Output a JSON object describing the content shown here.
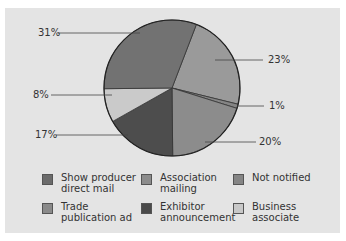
{
  "chart_data": {
    "type": "pie",
    "title": "",
    "categories": [
      "Show producer direct mail",
      "Trade publication ad",
      "Not notified",
      "Association mailing",
      "Exhibitor announcement",
      "Business associate"
    ],
    "values": [
      31,
      23,
      1,
      20,
      17,
      8
    ],
    "unit": "%",
    "colors": [
      "#727272",
      "#9a9a9a",
      "#858585",
      "#8c8c8c",
      "#4d4d4d",
      "#cacaca"
    ],
    "legend_position": "bottom",
    "slice_labels": [
      "31%",
      "23%",
      "1%",
      "20%",
      "17%",
      "8%"
    ]
  },
  "legend": [
    {
      "label": "Show producer\ndirect mail",
      "color": "#6b6b6b"
    },
    {
      "label": "Association\nmailing",
      "color": "#8c8c8c"
    },
    {
      "label": "Not notified",
      "color": "#858585"
    },
    {
      "label": "Trade\npublication ad",
      "color": "#8a8a8a"
    },
    {
      "label": "Exhibitor\nannouncement",
      "color": "#4a4a4a"
    },
    {
      "label": "Business\nassociate",
      "color": "#c8c8c8"
    }
  ]
}
